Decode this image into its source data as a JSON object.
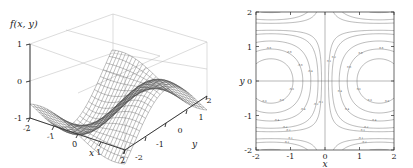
{
  "figure": {
    "background_color": "#ffffff",
    "panels": [
      {
        "name": "surface-plot",
        "type": "surface3d",
        "zlabel": "f(x, y)",
        "xlabel": "x",
        "ylabel": "y",
        "xticks": [
          "-2",
          "-1",
          "0",
          "1",
          "2"
        ],
        "yticks": [
          "-2",
          "-1",
          "0",
          "1",
          "2"
        ],
        "zticks": [
          "-1",
          "0",
          "1"
        ]
      },
      {
        "name": "contour-plot",
        "type": "contour",
        "xlabel": "x",
        "ylabel": "y",
        "xticks": [
          "-2",
          "-1",
          "0",
          "1",
          "2"
        ],
        "yticks": [
          "-2",
          "-1",
          "0",
          "1",
          "2"
        ]
      }
    ]
  },
  "chart_data": [
    {
      "type": "line",
      "subtype": "surface-wireframe-3d",
      "title": "",
      "xlabel": "x",
      "ylabel": "y",
      "zlabel": "f(x, y)",
      "xlim": [
        -2,
        2
      ],
      "ylim": [
        -2,
        2
      ],
      "zlim": [
        -1,
        1
      ],
      "xticks": [
        -2,
        -1,
        0,
        1,
        2
      ],
      "yticks": [
        -2,
        -1,
        0,
        1,
        2
      ],
      "zticks": [
        -1,
        0,
        1
      ],
      "grid": true,
      "legend": null,
      "mesh_color": "#3a3a3a",
      "mesh_n": 29,
      "function": "f(x,y) = sin(x)*cos(y)  (saddle-type surface with two peaks and two troughs over [-2,2]^2)",
      "notes": "Wireframe mesh surface drawn on a 3-wall box frame; peaks near (x,y)=(-1.6,-2) and (1.6,2); trough running through the middle."
    },
    {
      "type": "line",
      "subtype": "contour",
      "title": "",
      "xlabel": "x",
      "ylabel": "y",
      "xlim": [
        -2,
        2
      ],
      "ylim": [
        -2,
        2
      ],
      "xticks": [
        -2,
        -1,
        0,
        1,
        2
      ],
      "yticks": [
        -2,
        -1,
        0,
        1,
        2
      ],
      "grid": false,
      "legend": null,
      "frame": true,
      "line_color": "#555555",
      "function": "f(x,y) = x*y-type saddle; level curves are hyperbola-like families symmetric about both axes",
      "levels": [
        -0.8,
        -0.6,
        -0.4,
        -0.2,
        -0.1,
        0.0,
        0.1,
        0.2,
        0.4,
        0.6,
        0.8
      ],
      "level_labels": [
        "-0.8",
        "-0.6",
        "-0.4",
        "-0.2",
        "-0.1",
        "0",
        "0.1",
        "0.2",
        "0.4",
        "0.6",
        "0.8"
      ],
      "notes": "Inline contour labels; the zero level consists of the two straight axes x=0 and y=0 crossing at the origin."
    }
  ]
}
